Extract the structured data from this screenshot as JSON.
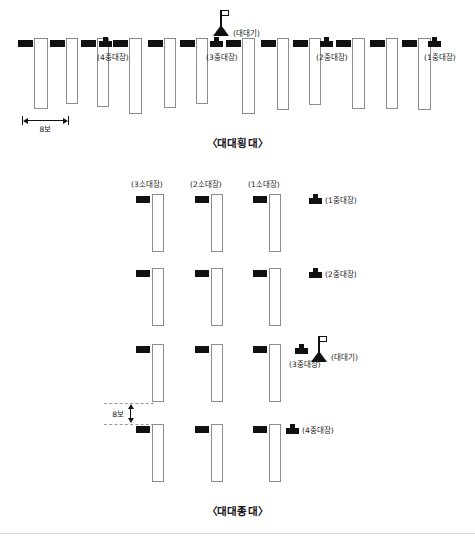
{
  "document": {
    "kind": "military-formation-diagram",
    "language": "ko"
  },
  "figures": [
    {
      "id": "battalion-line",
      "title": "〈대대횡대〉",
      "dimension": {
        "label": "8보",
        "orientation": "horizontal"
      },
      "flag": {
        "label": "(대대기)"
      },
      "company_commanders": [
        {
          "label": "(4중대장)"
        },
        {
          "label": "(3중대장)"
        },
        {
          "label": "(2중대장)"
        },
        {
          "label": "(1중대장)"
        }
      ]
    },
    {
      "id": "battalion-column",
      "title": "〈대대종대〉",
      "dimension": {
        "label": "8보",
        "orientation": "vertical"
      },
      "flag": {
        "label": "(대대기)"
      },
      "platoon_leaders": [
        {
          "label": "(3소대장)"
        },
        {
          "label": "(2소대장)"
        },
        {
          "label": "(1소대장)"
        }
      ],
      "company_commanders": [
        {
          "label": "(1중대장)"
        },
        {
          "label": "(2중대장)"
        },
        {
          "label": "(3중대장)"
        },
        {
          "label": "(4중대장)"
        }
      ]
    }
  ],
  "colors": {
    "marker": "#111111",
    "block_outline": "#8c8c8c",
    "background": "#ffffff",
    "rule": "#d8d8d8"
  }
}
